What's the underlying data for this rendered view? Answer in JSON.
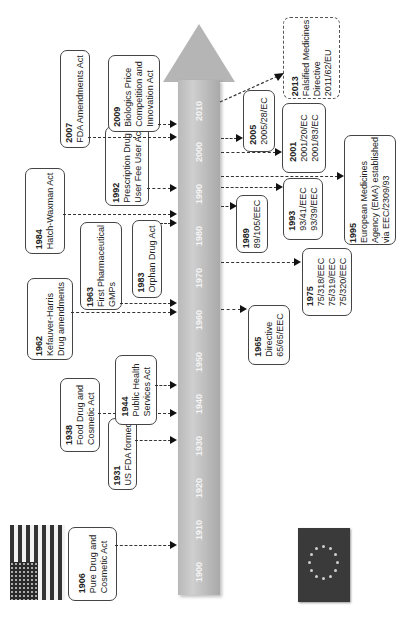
{
  "axis": {
    "years": [
      "1900",
      "1910",
      "1920",
      "1930",
      "1940",
      "1950",
      "1960",
      "1970",
      "1980",
      "1990",
      "2000",
      "2010"
    ]
  },
  "flags": {
    "us": "us-flag",
    "eu": "eu-flag"
  },
  "us_events": [
    {
      "year": "1906",
      "lines": [
        "Pure Drug and",
        "Cosmetic Act"
      ]
    },
    {
      "year": "1931",
      "lines": [
        "US FDA formed"
      ]
    },
    {
      "year": "1938",
      "lines": [
        "Food Drug and",
        "Cosmetic Act"
      ]
    },
    {
      "year": "1944",
      "lines": [
        "Public Health",
        "Services Act"
      ]
    },
    {
      "year": "1962",
      "lines": [
        "Kefauver-Harris",
        "Drug amendments"
      ]
    },
    {
      "year": "1963",
      "lines": [
        "First Pharmaceutical",
        "GMPs"
      ]
    },
    {
      "year": "1983",
      "lines": [
        "Orphan Drug Act"
      ]
    },
    {
      "year": "1984",
      "lines": [
        "Hatch-Waxman Act"
      ]
    },
    {
      "year": "1992",
      "lines": [
        "Prescription Drug",
        "User Fee User Act"
      ]
    },
    {
      "year": "2007",
      "lines": [
        "FDA Amendments Act"
      ]
    },
    {
      "year": "2009",
      "lines": [
        "Biologics Price",
        "Competition and",
        "Innovation Act"
      ]
    }
  ],
  "eu_events": [
    {
      "year": "1965",
      "lines": [
        "Directive",
        "65/65/EEC"
      ]
    },
    {
      "year": "1975",
      "lines": [
        "75/318/EEC",
        "75/319/EEC",
        "75/320/EEC"
      ]
    },
    {
      "year": "1989",
      "lines": [
        "89/105/EEC"
      ]
    },
    {
      "year": "1993",
      "lines": [
        "93/41/EEC",
        "93/39/EEC"
      ]
    },
    {
      "year": "1995",
      "lines": [
        "European Medicines",
        "Agency (EMA) established",
        "via EEC/2309/93"
      ]
    },
    {
      "year": "2001",
      "lines": [
        "2001/20/EC",
        "2001/83/EC"
      ]
    },
    {
      "year": "2005",
      "lines": [
        "2005/28/EC"
      ]
    },
    {
      "year": "2013",
      "lines": [
        "Falsified Medicines",
        "Directive",
        "2011/62/EU"
      ]
    }
  ]
}
